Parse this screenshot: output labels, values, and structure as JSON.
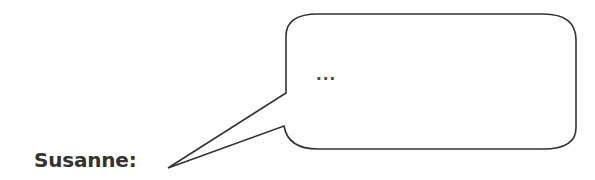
{
  "speaker": {
    "name": "Susanne:"
  },
  "bubble": {
    "text": "...",
    "stroke_color": "#333333",
    "fill_color": "#ffffff"
  }
}
